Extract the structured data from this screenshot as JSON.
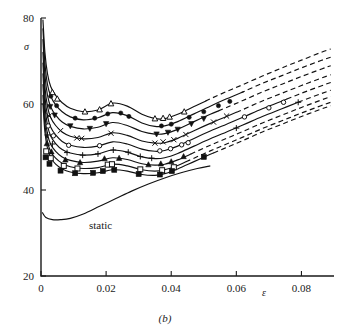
{
  "figure": {
    "caption": "(b)",
    "annotation_static": "static"
  },
  "axes": {
    "y_label": "σ",
    "x_label": "ε",
    "y_ticks": [
      "20",
      "40",
      "60",
      "80"
    ],
    "x_ticks": [
      "0",
      "0.02",
      "0.04",
      "0.06",
      "0.08"
    ]
  },
  "chart_data": {
    "type": "line",
    "title": "",
    "subtitle": "",
    "xlabel": "ε",
    "ylabel": "σ",
    "xlim": [
      0,
      0.09
    ],
    "ylim": [
      20,
      80
    ],
    "x_ticks": [
      0,
      0.02,
      0.04,
      0.06,
      0.08
    ],
    "y_ticks": [
      20,
      40,
      60,
      80
    ],
    "grid": false,
    "legend": "none",
    "annotations": [
      {
        "text": "static",
        "x": 0.0165,
        "y": 33.2
      },
      {
        "text": "(b)",
        "x": 0.042,
        "y": 21.0
      }
    ],
    "series": [
      {
        "name": "curve-1",
        "marker": "open-triangle-up",
        "x": [
          0.0006,
          0.0012,
          0.002,
          0.003,
          0.0045,
          0.0065,
          0.009,
          0.013,
          0.0175,
          0.022,
          0.0265,
          0.031,
          0.035,
          0.038,
          0.042,
          0.047,
          0.052,
          0.057,
          0.062,
          0.068,
          0.074,
          0.08,
          0.086,
          0.089
        ],
        "y": [
          79.5,
          72.0,
          67.0,
          64.0,
          62.0,
          60.3,
          59.0,
          58.2,
          58.6,
          60.2,
          59.5,
          57.6,
          56.6,
          56.6,
          57.6,
          59.4,
          61.2,
          62.9,
          64.5,
          66.5,
          68.4,
          70.2,
          72.0,
          72.8
        ],
        "solid_to": 0.0505,
        "marker_x": [
          0.0035,
          0.005,
          0.0135,
          0.018,
          0.0215,
          0.035,
          0.0375,
          0.0395,
          0.044
        ],
        "marker_y": [
          62.7,
          61.2,
          58.2,
          58.7,
          60.1,
          56.6,
          56.7,
          57.0,
          58.2
        ]
      },
      {
        "name": "curve-2",
        "marker": "filled-circle",
        "x": [
          0.0006,
          0.0012,
          0.002,
          0.003,
          0.0045,
          0.0065,
          0.009,
          0.013,
          0.0175,
          0.022,
          0.0265,
          0.031,
          0.035,
          0.038,
          0.042,
          0.047,
          0.052,
          0.057,
          0.062,
          0.068,
          0.074,
          0.08,
          0.086,
          0.089
        ],
        "y": [
          77.5,
          69.5,
          64.5,
          61.8,
          59.8,
          58.2,
          57.0,
          56.3,
          56.8,
          58.0,
          57.3,
          55.6,
          54.8,
          54.9,
          55.9,
          57.7,
          59.5,
          61.2,
          62.8,
          64.8,
          66.6,
          68.4,
          70.1,
          70.9
        ],
        "solid_to": 0.062,
        "marker_x": [
          0.003,
          0.0048,
          0.0105,
          0.0165,
          0.0205,
          0.0245,
          0.027,
          0.037,
          0.04,
          0.0455,
          0.05,
          0.0545,
          0.058
        ],
        "marker_y": [
          61.8,
          59.6,
          56.7,
          56.7,
          57.7,
          57.9,
          57.1,
          54.9,
          55.3,
          56.9,
          58.2,
          59.6,
          60.6
        ]
      },
      {
        "name": "curve-3",
        "marker": "filled-triangle-down",
        "x": [
          0.0006,
          0.0012,
          0.002,
          0.003,
          0.0045,
          0.0065,
          0.009,
          0.013,
          0.0175,
          0.022,
          0.0265,
          0.031,
          0.035,
          0.038,
          0.042,
          0.047,
          0.052,
          0.057,
          0.062,
          0.068,
          0.074,
          0.08,
          0.086,
          0.089
        ],
        "y": [
          75.0,
          66.8,
          62.0,
          59.3,
          57.4,
          55.8,
          54.8,
          54.2,
          54.6,
          55.7,
          55.0,
          53.6,
          53.0,
          53.1,
          54.1,
          55.9,
          57.6,
          59.2,
          60.8,
          62.8,
          64.6,
          66.4,
          68.1,
          68.9
        ],
        "solid_to": 0.0545,
        "marker_x": [
          0.0028,
          0.0042,
          0.009,
          0.015,
          0.02,
          0.0355,
          0.039,
          0.042,
          0.0462,
          0.05
        ],
        "marker_y": [
          59.4,
          57.4,
          54.9,
          54.3,
          55.4,
          53.0,
          53.4,
          54.1,
          55.4,
          56.6
        ]
      },
      {
        "name": "curve-4",
        "marker": "x-cross",
        "x": [
          0.0006,
          0.0012,
          0.002,
          0.003,
          0.0045,
          0.0065,
          0.009,
          0.013,
          0.0175,
          0.022,
          0.0265,
          0.031,
          0.035,
          0.038,
          0.042,
          0.047,
          0.052,
          0.057,
          0.062,
          0.068,
          0.074,
          0.08,
          0.086,
          0.089
        ],
        "y": [
          72.0,
          64.0,
          59.4,
          56.8,
          55.0,
          53.5,
          52.5,
          51.9,
          52.2,
          53.3,
          52.7,
          51.4,
          50.9,
          51.0,
          52.0,
          53.8,
          55.5,
          57.1,
          58.7,
          60.7,
          62.5,
          64.3,
          66.0,
          66.8
        ],
        "solid_to": 0.06,
        "marker_x": [
          0.0025,
          0.006,
          0.011,
          0.0125,
          0.0215,
          0.035,
          0.0375,
          0.0408,
          0.0445,
          0.053,
          0.057
        ],
        "marker_y": [
          57.2,
          53.8,
          52.1,
          52.0,
          53.2,
          50.9,
          51.2,
          51.7,
          52.9,
          55.8,
          57.2
        ]
      },
      {
        "name": "curve-5",
        "marker": "open-circle",
        "x": [
          0.0006,
          0.0012,
          0.002,
          0.003,
          0.0045,
          0.0065,
          0.009,
          0.013,
          0.0175,
          0.022,
          0.0265,
          0.031,
          0.035,
          0.038,
          0.042,
          0.047,
          0.052,
          0.057,
          0.062,
          0.068,
          0.074,
          0.08,
          0.086,
          0.089
        ],
        "y": [
          69.5,
          61.8,
          57.2,
          54.6,
          52.8,
          51.3,
          50.4,
          49.9,
          50.2,
          51.2,
          50.7,
          49.5,
          49.0,
          49.2,
          50.2,
          52.0,
          53.7,
          55.3,
          56.9,
          58.9,
          60.7,
          62.5,
          64.2,
          65.0
        ],
        "solid_to": 0.0755,
        "marker_x": [
          0.0022,
          0.0038,
          0.0085,
          0.018,
          0.0365,
          0.0398,
          0.0432,
          0.0452,
          0.0625,
          0.07,
          0.0745
        ],
        "marker_y": [
          54.9,
          52.6,
          50.4,
          50.3,
          49.1,
          49.6,
          50.5,
          51.0,
          57.0,
          59.1,
          60.4
        ]
      },
      {
        "name": "curve-6",
        "marker": "plus",
        "x": [
          0.0006,
          0.0012,
          0.002,
          0.003,
          0.0045,
          0.0065,
          0.009,
          0.013,
          0.0175,
          0.022,
          0.0265,
          0.031,
          0.035,
          0.038,
          0.042,
          0.047,
          0.052,
          0.057,
          0.062,
          0.068,
          0.074,
          0.08,
          0.086,
          0.089
        ],
        "y": [
          67.0,
          59.5,
          55.0,
          52.5,
          50.8,
          49.4,
          48.6,
          48.1,
          48.4,
          49.3,
          48.8,
          47.7,
          47.3,
          47.5,
          48.5,
          50.2,
          51.9,
          53.5,
          55.1,
          57.1,
          58.9,
          60.7,
          62.4,
          63.2
        ],
        "solid_to": 0.079,
        "marker_x": [
          0.002,
          0.0035,
          0.008,
          0.0128,
          0.0175,
          0.0222,
          0.0268,
          0.0305,
          0.034,
          0.06,
          0.079
        ],
        "marker_y": [
          52.8,
          50.7,
          48.7,
          48.1,
          48.4,
          49.3,
          48.8,
          47.8,
          47.4,
          54.4,
          60.4
        ]
      },
      {
        "name": "curve-7",
        "marker": "filled-triangle-up",
        "x": [
          0.0006,
          0.0012,
          0.002,
          0.003,
          0.0045,
          0.0065,
          0.009,
          0.013,
          0.0175,
          0.022,
          0.0265,
          0.031,
          0.035,
          0.038,
          0.042,
          0.047,
          0.052,
          0.057,
          0.062,
          0.068,
          0.074,
          0.08,
          0.086,
          0.089
        ],
        "y": [
          64.5,
          57.3,
          53.0,
          50.6,
          49.0,
          47.7,
          46.9,
          46.4,
          46.7,
          47.5,
          47.1,
          46.1,
          45.8,
          46.0,
          47.0,
          48.7,
          50.4,
          52.0,
          53.6,
          55.6,
          57.4,
          59.2,
          60.9,
          61.7
        ],
        "solid_to": 0.046,
        "marker_x": [
          0.0018,
          0.0032,
          0.0075,
          0.012,
          0.0195,
          0.024,
          0.033,
          0.0368,
          0.04,
          0.0438
        ],
        "marker_y": [
          50.8,
          48.9,
          47.0,
          46.4,
          47.3,
          47.4,
          45.9,
          46.1,
          46.6,
          47.8
        ]
      },
      {
        "name": "curve-8",
        "marker": "open-square",
        "x": [
          0.0006,
          0.0012,
          0.002,
          0.003,
          0.0045,
          0.0065,
          0.009,
          0.013,
          0.0175,
          0.022,
          0.0265,
          0.031,
          0.035,
          0.038,
          0.042,
          0.047,
          0.052,
          0.057,
          0.062,
          0.068,
          0.074,
          0.08,
          0.086,
          0.089
        ],
        "y": [
          62.0,
          55.2,
          51.2,
          48.9,
          47.4,
          46.2,
          45.4,
          45.0,
          45.2,
          46.0,
          45.6,
          44.7,
          44.4,
          44.7,
          45.7,
          47.4,
          49.1,
          50.7,
          52.3,
          54.3,
          56.1,
          57.9,
          59.6,
          60.4
        ],
        "solid_to": 0.0445,
        "marker_x": [
          0.0016,
          0.003,
          0.007,
          0.0112,
          0.0205,
          0.0218,
          0.0305,
          0.0372,
          0.0408
        ],
        "marker_y": [
          49.0,
          47.4,
          45.6,
          45.0,
          45.9,
          46.0,
          44.8,
          44.6,
          45.3
        ]
      },
      {
        "name": "curve-9",
        "marker": "filled-square",
        "x": [
          0.0006,
          0.0012,
          0.002,
          0.003,
          0.0045,
          0.0065,
          0.009,
          0.013,
          0.0175,
          0.022,
          0.0265,
          0.031,
          0.035,
          0.038,
          0.042,
          0.047,
          0.052,
          0.057,
          0.062,
          0.068,
          0.074,
          0.08,
          0.086,
          0.089
        ],
        "y": [
          60.0,
          53.5,
          49.7,
          47.5,
          46.0,
          44.9,
          44.2,
          43.8,
          44.0,
          44.7,
          44.4,
          43.6,
          43.4,
          43.8,
          44.9,
          46.6,
          48.3,
          49.9,
          51.5,
          53.5,
          55.3,
          57.1,
          58.8,
          59.6
        ],
        "solid_to": 0.053,
        "marker_x": [
          0.0014,
          0.0026,
          0.006,
          0.0105,
          0.016,
          0.019,
          0.0225,
          0.03,
          0.0365,
          0.0402,
          0.05
        ],
        "marker_y": [
          47.6,
          46.1,
          44.5,
          43.9,
          44.0,
          44.4,
          44.7,
          43.7,
          43.6,
          44.4,
          47.7
        ]
      },
      {
        "name": "static",
        "marker": "none",
        "x": [
          0.0004,
          0.0015,
          0.0035,
          0.006,
          0.009,
          0.013,
          0.018,
          0.023,
          0.028,
          0.033,
          0.038,
          0.043,
          0.048,
          0.052
        ],
        "y": [
          34.8,
          33.6,
          33.1,
          33.1,
          33.4,
          34.4,
          36.2,
          38.0,
          39.8,
          41.4,
          42.8,
          44.0,
          45.0,
          45.6
        ],
        "solid_to": 0.052,
        "marker_x": [],
        "marker_y": []
      }
    ]
  }
}
